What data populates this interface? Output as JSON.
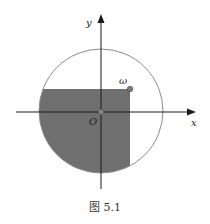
{
  "figure": {
    "caption": "图 5.1",
    "labels": {
      "x_axis": "x",
      "y_axis": "y",
      "origin": "O",
      "point": "ω"
    },
    "colors": {
      "shade": "#6f6f6f",
      "circle": "#8a8a8a",
      "axis": "#1a1a1a",
      "point": "#7a7a7a"
    }
  }
}
